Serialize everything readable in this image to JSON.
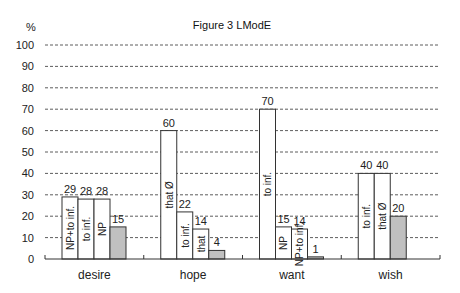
{
  "chart_data": {
    "type": "bar",
    "title": "Figure 3  LModE",
    "ylabel": "%",
    "xlabel": "",
    "ylim": [
      0,
      100
    ],
    "yticks": [
      0,
      10,
      20,
      30,
      40,
      50,
      60,
      70,
      80,
      90,
      100
    ],
    "grid": true,
    "legend": "none",
    "colors": {
      "open": "#ffffff",
      "filled": "#c0c0c0",
      "line": "#333333"
    },
    "categories": [
      "desire",
      "hope",
      "want",
      "wish"
    ],
    "groups": [
      {
        "category": "desire",
        "bars": [
          {
            "label": "NP+to inf.",
            "value": 29,
            "filled": false
          },
          {
            "label": "to inf.",
            "value": 28,
            "filled": false
          },
          {
            "label": "NP",
            "value": 28,
            "filled": false
          },
          {
            "label": "",
            "value": 15,
            "filled": true
          }
        ]
      },
      {
        "category": "hope",
        "bars": [
          {
            "label": "that Ø",
            "value": 60,
            "filled": false
          },
          {
            "label": "to inf.",
            "value": 22,
            "filled": false
          },
          {
            "label": "that",
            "value": 14,
            "filled": false
          },
          {
            "label": "",
            "value": 4,
            "filled": true
          }
        ]
      },
      {
        "category": "want",
        "bars": [
          {
            "label": "to inf.",
            "value": 70,
            "filled": false
          },
          {
            "label": "NP",
            "value": 15,
            "filled": false
          },
          {
            "label": "NP+to inf.",
            "value": 14,
            "filled": false
          },
          {
            "label": "",
            "value": 1,
            "filled": true
          }
        ]
      },
      {
        "category": "wish",
        "bars": [
          {
            "label": "to inf.",
            "value": 40,
            "filled": false
          },
          {
            "label": "that Ø",
            "value": 40,
            "filled": false
          },
          {
            "label": "",
            "value": 20,
            "filled": true
          }
        ]
      }
    ]
  }
}
